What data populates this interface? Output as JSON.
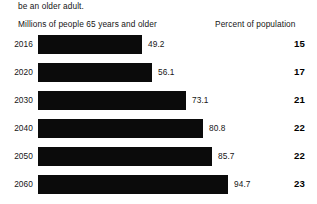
{
  "intro_fragment": "be an older adult.",
  "headers": {
    "left": "Millions of people 65 years and older",
    "right": "Percent of population"
  },
  "colors": {
    "bar": "#0b0b0b",
    "background": "#ffffff",
    "text": "#151515",
    "percent_text": "#000000"
  },
  "chart_data": {
    "type": "bar",
    "title": "",
    "subtitle": "",
    "xlabel": "Millions of people 65 years and older",
    "ylabel": "",
    "orientation": "horizontal",
    "grid": false,
    "legend": false,
    "categories": [
      "2016",
      "2020",
      "2030",
      "2040",
      "2050",
      "2060"
    ],
    "values": [
      49.2,
      56.1,
      73.1,
      80.8,
      85.7,
      94.7
    ],
    "value_labels": [
      "49.2",
      "56.1",
      "73.1",
      "80.8",
      "85.7",
      "94.7"
    ],
    "xlim": [
      0,
      100
    ],
    "series": [
      {
        "name": "Millions of people 65 years and older",
        "values": [
          49.2,
          56.1,
          73.1,
          80.8,
          85.7,
          94.7
        ]
      },
      {
        "name": "Percent of population",
        "values": [
          15,
          17,
          21,
          22,
          22,
          23
        ]
      }
    ]
  },
  "rows": [
    {
      "year": "2016",
      "millions": "49.2",
      "bar_px": 104,
      "percent": "15"
    },
    {
      "year": "2020",
      "millions": "56.1",
      "bar_px": 114,
      "percent": "17"
    },
    {
      "year": "2030",
      "millions": "73.1",
      "bar_px": 148,
      "percent": "21"
    },
    {
      "year": "2040",
      "millions": "80.8",
      "bar_px": 165,
      "percent": "22"
    },
    {
      "year": "2050",
      "millions": "85.7",
      "bar_px": 174,
      "percent": "22"
    },
    {
      "year": "2060",
      "millions": "94.7",
      "bar_px": 190,
      "percent": "23"
    }
  ]
}
